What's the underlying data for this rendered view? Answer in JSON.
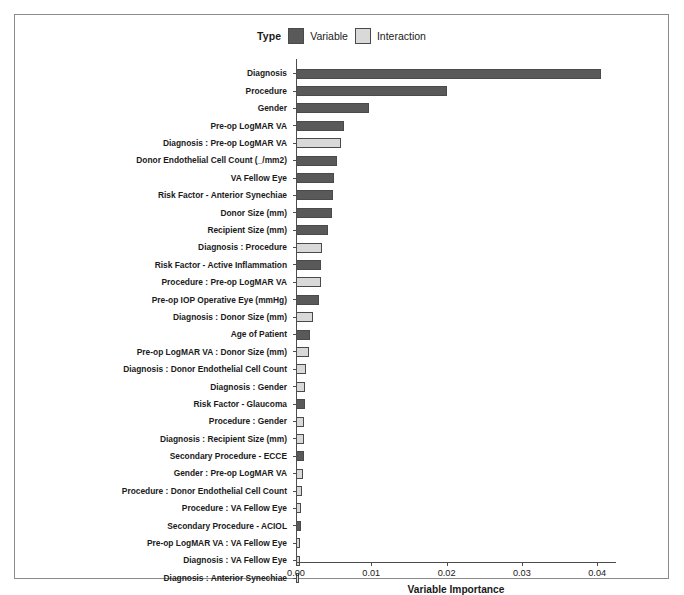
{
  "chart_data": {
    "type": "bar",
    "orientation": "horizontal",
    "title": "",
    "xlabel": "Variable Importance",
    "ylabel": "",
    "xlim": [
      0,
      0.0425
    ],
    "xticks": [
      "0.00",
      "0.01",
      "0.02",
      "0.03",
      "0.04"
    ],
    "xtick_values": [
      0.0,
      0.01,
      0.02,
      0.03,
      0.04
    ],
    "grid": false,
    "legend": {
      "title": "Type",
      "position": "top-center",
      "entries": [
        {
          "label": "Variable",
          "color": "#595959"
        },
        {
          "label": "Interaction",
          "color": "#d9d9d9"
        }
      ]
    },
    "categories": [
      "Diagnosis",
      "Procedure",
      "Gender",
      "Pre-op LogMAR VA",
      "Diagnosis : Pre-op LogMAR VA",
      "Donor Endothelial Cell Count (_/mm2)",
      "VA Fellow Eye",
      "Risk Factor - Anterior Synechiae",
      "Donor Size (mm)",
      "Recipient Size (mm)",
      "Diagnosis : Procedure",
      "Risk Factor - Active Inflammation",
      "Procedure : Pre-op LogMAR VA",
      "Pre-op IOP Operative Eye (mmHg)",
      "Diagnosis : Donor Size (mm)",
      "Age of Patient",
      "Pre-op LogMAR VA : Donor Size (mm)",
      "Diagnosis : Donor Endothelial Cell Count",
      "Diagnosis : Gender",
      "Risk Factor - Glaucoma",
      "Procedure : Gender",
      "Diagnosis : Recipient Size (mm)",
      "Secondary Procedure - ECCE",
      "Gender : Pre-op LogMAR VA",
      "Procedure : Donor Endothelial Cell Count",
      "Procedure : VA Fellow Eye",
      "Secondary Procedure - ACIOL",
      "Pre-op LogMAR VA : VA Fellow Eye",
      "Diagnosis : VA Fellow Eye",
      "Diagnosis : Anterior Synechiae"
    ],
    "values": [
      0.0405,
      0.02,
      0.0097,
      0.0064,
      0.006,
      0.0055,
      0.0051,
      0.0049,
      0.0048,
      0.0042,
      0.0034,
      0.0033,
      0.0033,
      0.0031,
      0.0022,
      0.0019,
      0.0017,
      0.0013,
      0.0012,
      0.0012,
      0.0011,
      0.001,
      0.001,
      0.0009,
      0.0008,
      0.0007,
      0.0007,
      0.0005,
      0.0005,
      0.0004
    ],
    "types": [
      "Variable",
      "Variable",
      "Variable",
      "Variable",
      "Interaction",
      "Variable",
      "Variable",
      "Variable",
      "Variable",
      "Variable",
      "Interaction",
      "Variable",
      "Interaction",
      "Variable",
      "Interaction",
      "Variable",
      "Interaction",
      "Interaction",
      "Interaction",
      "Variable",
      "Interaction",
      "Interaction",
      "Variable",
      "Interaction",
      "Interaction",
      "Interaction",
      "Variable",
      "Interaction",
      "Interaction",
      "Interaction"
    ]
  }
}
